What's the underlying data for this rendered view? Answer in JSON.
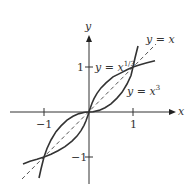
{
  "axes": {
    "x_label": "x",
    "y_label": "y",
    "x_ticks": [
      {
        "value": -1,
        "label": "−1"
      },
      {
        "value": 1,
        "label": "1"
      }
    ],
    "y_ticks": [
      {
        "value": 1,
        "label": "1"
      },
      {
        "value": -1,
        "label": "−1"
      }
    ]
  },
  "curves": {
    "identity": {
      "label_lhs": "y = ",
      "label_var": "x",
      "style": "dashed"
    },
    "cube_root": {
      "label_lhs": "y = ",
      "label_var": "x",
      "label_exp": "1/3",
      "style": "solid"
    },
    "cube": {
      "label_lhs": "y = ",
      "label_var": "x",
      "label_exp": "3",
      "style": "solid"
    }
  },
  "colors": {
    "curve": "#333333",
    "axis": "#333333"
  }
}
